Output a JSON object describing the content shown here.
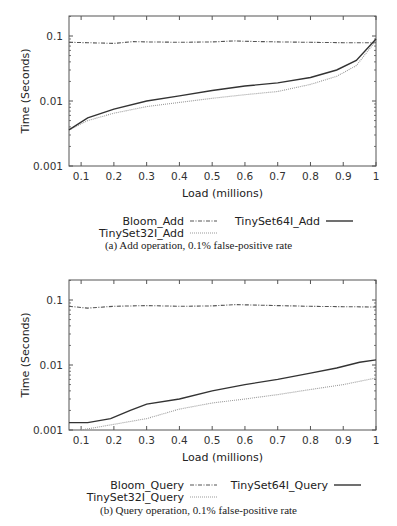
{
  "chart_data": [
    {
      "type": "line",
      "title": "",
      "caption": "(a) Add operation, 0.1% false-positive rate",
      "xlabel": "Load (millions)",
      "ylabel": "Time (Seconds)",
      "yscale": "log",
      "xlim": [
        0.063,
        1.0
      ],
      "ylim": [
        0.001,
        0.24
      ],
      "x_ticks": [
        "0.1",
        "0.2",
        "0.3",
        "0.4",
        "0.5",
        "0.6",
        "0.7",
        "0.8",
        "0.9",
        "1"
      ],
      "y_ticks": [
        "0.001",
        "0.01",
        "0.1"
      ],
      "grid": false,
      "legend_position": "below",
      "series": [
        {
          "name": "Bloom_Add",
          "style": "dash-dot",
          "x": [
            0.063,
            0.12,
            0.2,
            0.26,
            0.3,
            0.4,
            0.5,
            0.57,
            0.6,
            0.7,
            0.8,
            0.9,
            1.0
          ],
          "values": [
            0.08,
            0.079,
            0.077,
            0.082,
            0.081,
            0.08,
            0.081,
            0.084,
            0.083,
            0.081,
            0.08,
            0.079,
            0.079
          ]
        },
        {
          "name": "TinySet32I_Add",
          "style": "dotted",
          "x": [
            0.063,
            0.12,
            0.2,
            0.3,
            0.4,
            0.5,
            0.6,
            0.7,
            0.8,
            0.88,
            0.94,
            1.0
          ],
          "values": [
            0.0036,
            0.005,
            0.0065,
            0.0082,
            0.0095,
            0.011,
            0.0125,
            0.014,
            0.018,
            0.024,
            0.035,
            0.085
          ]
        },
        {
          "name": "TinySet64I_Add",
          "style": "solid",
          "x": [
            0.063,
            0.12,
            0.2,
            0.3,
            0.4,
            0.5,
            0.6,
            0.7,
            0.8,
            0.88,
            0.94,
            1.0
          ],
          "values": [
            0.0036,
            0.0055,
            0.0075,
            0.01,
            0.012,
            0.0145,
            0.017,
            0.019,
            0.023,
            0.03,
            0.042,
            0.09
          ]
        }
      ]
    },
    {
      "type": "line",
      "title": "",
      "caption": "(b) Query operation, 0.1% false-positive rate",
      "xlabel": "Load (millions)",
      "ylabel": "Time (Seconds)",
      "yscale": "log",
      "xlim": [
        0.063,
        1.0
      ],
      "ylim": [
        0.001,
        0.24
      ],
      "x_ticks": [
        "0.1",
        "0.2",
        "0.3",
        "0.4",
        "0.5",
        "0.6",
        "0.7",
        "0.8",
        "0.9",
        "1"
      ],
      "y_ticks": [
        "0.001",
        "0.01",
        "0.1"
      ],
      "grid": false,
      "legend_position": "below",
      "series": [
        {
          "name": "Bloom_Query",
          "style": "dash-dot",
          "x": [
            0.063,
            0.12,
            0.2,
            0.3,
            0.4,
            0.5,
            0.57,
            0.7,
            0.8,
            0.9,
            1.0
          ],
          "values": [
            0.08,
            0.075,
            0.08,
            0.082,
            0.08,
            0.081,
            0.085,
            0.082,
            0.08,
            0.079,
            0.078
          ]
        },
        {
          "name": "TinySet32I_Query",
          "style": "dotted",
          "x": [
            0.1,
            0.19,
            0.3,
            0.4,
            0.5,
            0.6,
            0.7,
            0.8,
            0.9,
            1.0
          ],
          "values": [
            0.001,
            0.0012,
            0.0015,
            0.0021,
            0.0026,
            0.003,
            0.0035,
            0.0042,
            0.005,
            0.0063
          ]
        },
        {
          "name": "TinySet64I_Query",
          "style": "solid",
          "x": [
            0.063,
            0.12,
            0.19,
            0.25,
            0.3,
            0.4,
            0.5,
            0.6,
            0.7,
            0.8,
            0.88,
            0.95,
            1.0
          ],
          "values": [
            0.0013,
            0.0013,
            0.0015,
            0.002,
            0.0025,
            0.003,
            0.004,
            0.005,
            0.006,
            0.0075,
            0.009,
            0.011,
            0.012
          ]
        }
      ]
    }
  ],
  "panels": [
    {
      "xlabel": "Load (millions)",
      "ylabel": "Time (Seconds)",
      "legend": {
        "bloom": "Bloom_Add",
        "t64": "TinySet64I_Add",
        "t32": "TinySet32I_Add"
      },
      "caption": "(a) Add operation, 0.1% false-positive rate"
    },
    {
      "xlabel": "Load (millions)",
      "ylabel": "Time (Seconds)",
      "legend": {
        "bloom": "Bloom_Query",
        "t64": "TinySet64I_Query",
        "t32": "TinySet32I_Query"
      },
      "caption": "(b) Query operation, 0.1% false-positive rate"
    }
  ],
  "colors": {
    "frame": "#555555",
    "solid": "#333333",
    "dashdot": "#555555",
    "dotted": "#9a9a9a"
  }
}
